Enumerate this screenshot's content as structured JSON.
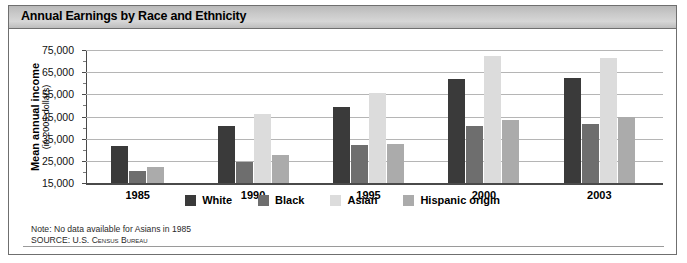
{
  "titlebar": {
    "title": "Annual Earnings by Race and Ethnicity"
  },
  "axis": {
    "ytitle_line1": "Mean annual income",
    "ytitle_line2": "(in 2005 dollars)"
  },
  "legend": {
    "items": [
      {
        "label": "White",
        "color": "#3a3a3a"
      },
      {
        "label": "Black",
        "color": "#6e6e6e"
      },
      {
        "label": "Asian",
        "color": "#dcdcdc"
      },
      {
        "label": "Hispanic origin",
        "color": "#ababab"
      }
    ]
  },
  "notes": {
    "note": "Note: No data available for Asians in 1985",
    "source": "SOURCE: U.S. Census Bureau"
  },
  "chart_data": {
    "type": "bar",
    "title": "Annual Earnings by Race and Ethnicity",
    "xlabel": "",
    "ylabel": "Mean annual income (in 2005 dollars)",
    "ylim": [
      15000,
      75000
    ],
    "yticks": [
      15000,
      25000,
      35000,
      45000,
      55000,
      65000,
      75000
    ],
    "ytick_labels": [
      "15,000",
      "25,000",
      "35,000",
      "45,000",
      "55,000",
      "65,000",
      "75,000"
    ],
    "grid": true,
    "legend_position": "bottom",
    "categories": [
      "1985",
      "1990",
      "1995",
      "2000",
      "2003"
    ],
    "series": [
      {
        "name": "White",
        "color": "#3a3a3a",
        "values": [
          31500,
          40500,
          49500,
          62000,
          62500
        ]
      },
      {
        "name": "Black",
        "color": "#6e6e6e",
        "values": [
          20500,
          24500,
          32000,
          40500,
          41500
        ]
      },
      {
        "name": "Asian",
        "color": "#dcdcdc",
        "values": [
          null,
          46000,
          55500,
          72500,
          71500
        ]
      },
      {
        "name": "Hispanic origin",
        "color": "#ababab",
        "values": [
          22000,
          27500,
          32500,
          43500,
          45000
        ]
      }
    ],
    "annotations": [
      "Note: No data available for Asians in 1985",
      "SOURCE: U.S. Census Bureau"
    ]
  }
}
